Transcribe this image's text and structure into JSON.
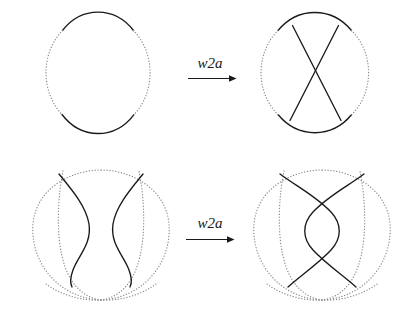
{
  "figure": {
    "background_color": "#ffffff",
    "solid_stroke_color": "#1a1a1a",
    "dotted_stroke_color": "#8a8a8a",
    "width": 404,
    "height": 318
  },
  "rows": [
    {
      "id": "row-top",
      "operation_label": "w2a",
      "left": {
        "name": "circle-unknotted",
        "description": "circle with solid top arc and solid bottom arc, dotted left and right arcs",
        "crossings": 0,
        "solid_arcs": 2,
        "dotted_arcs": 2
      },
      "right": {
        "name": "circle-with-x-crossing",
        "description": "circle with two straight chords crossing once in an X, solid top and bottom arcs, dotted sides",
        "crossings": 1,
        "solid_arcs": 4,
        "dotted_arcs": 2
      }
    },
    {
      "id": "row-bottom",
      "operation_label": "w2a",
      "left": {
        "name": "horseshoe-pair-uncrossed",
        "description": "dotted outer oval with dotted inner horseshoe loop, two solid S-curves facing each other, no solid crossings",
        "crossings": 0,
        "solid_arcs": 2,
        "dotted_arcs": 2
      },
      "right": {
        "name": "horseshoe-pair-double-crossed",
        "description": "dotted outer oval with dotted inner horseshoe loop, two solid curves crossing twice forming a lens shape",
        "crossings": 2,
        "solid_arcs": 2,
        "dotted_arcs": 2
      }
    }
  ],
  "arrows": [
    {
      "name": "arrow-top",
      "label": "w2a",
      "direction": "right"
    },
    {
      "name": "arrow-bottom",
      "label": "w2a",
      "direction": "right"
    }
  ]
}
